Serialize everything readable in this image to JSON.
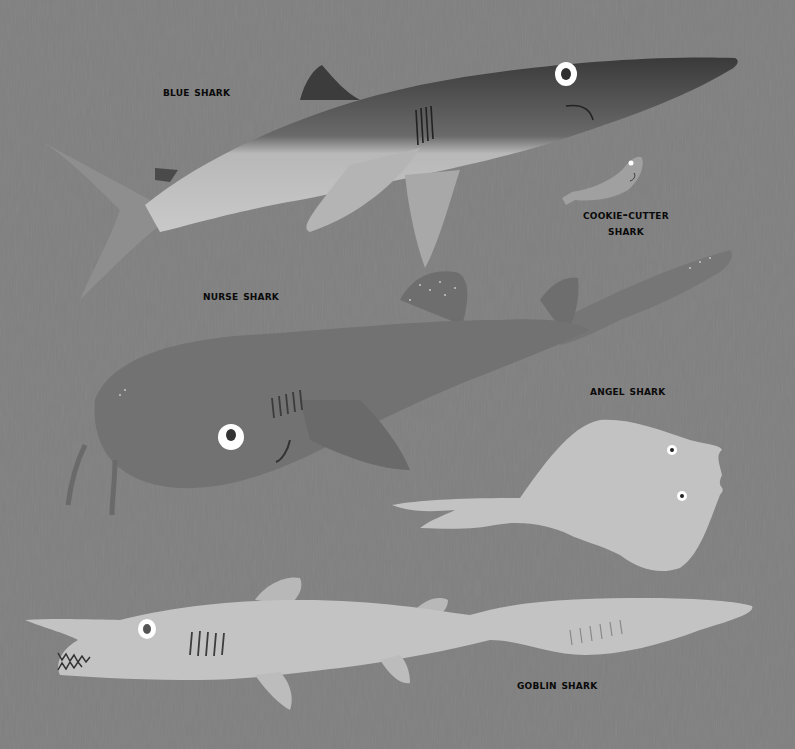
{
  "colors": {
    "background": "#808080",
    "label_text": "#0a0a0a"
  },
  "sharks": [
    {
      "id": "blue",
      "label": "BLUE SHARK"
    },
    {
      "id": "cookie-cutter",
      "label_line1": "COOKIE-CUTTER",
      "label_line2": "SHARK"
    },
    {
      "id": "nurse",
      "label": "NURSE SHARK"
    },
    {
      "id": "angel",
      "label": "ANGEL SHARK"
    },
    {
      "id": "goblin",
      "label": "GOBLIN SHARK"
    }
  ]
}
